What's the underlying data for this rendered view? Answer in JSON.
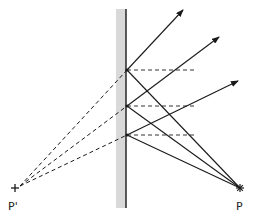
{
  "diagram": {
    "colors": {
      "mirror_band": "#d9d9d9",
      "mirror_line": "#1a1a1a",
      "ray": "#1a1a1a",
      "normal": "#333333"
    },
    "mirror": {
      "x": 126,
      "band_x": 116,
      "band_w": 10,
      "y_top": 9,
      "y_bottom": 208
    },
    "source": {
      "label": "P",
      "x": 240,
      "y": 188,
      "label_x": 236,
      "label_y": 210,
      "marker": "asterisk"
    },
    "image": {
      "label": "P'",
      "x": 15,
      "y": 188,
      "label_x": 8,
      "label_y": 210,
      "marker": "cross"
    },
    "virtual_focus": {
      "x": 20,
      "y": 186
    },
    "reflection_points": [
      {
        "x": 127,
        "y": 70,
        "normal_end_x": 197,
        "arrow_tip": {
          "x": 183,
          "y": 10
        }
      },
      {
        "x": 127,
        "y": 106,
        "normal_end_x": 197,
        "arrow_tip": {
          "x": 219,
          "y": 37
        }
      },
      {
        "x": 127,
        "y": 135,
        "normal_end_x": 197,
        "arrow_tip": {
          "x": 238,
          "y": 81
        }
      }
    ]
  }
}
